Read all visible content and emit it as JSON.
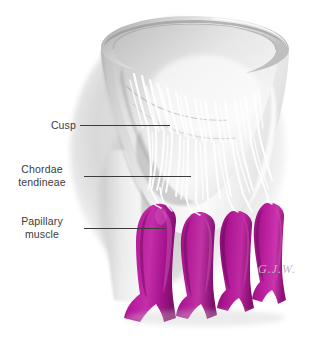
{
  "figure": {
    "signature": "G.J.W.",
    "background_color": "#ffffff"
  },
  "labels": [
    {
      "name": "cusp",
      "line1": "Cusp",
      "line2": ""
    },
    {
      "name": "chordae-tendineae",
      "line1": "Chordae",
      "line2": "tendineae"
    },
    {
      "name": "papillary-muscle",
      "line1": "Papillary",
      "line2": "muscle"
    }
  ],
  "colors": {
    "label_text": "#3b3b3b",
    "leader_line": "#3b3b3b",
    "papillary_muscle": "#b5189b",
    "papillary_muscle_shadow": "#8e1078",
    "papillary_muscle_highlight": "#d04cb9",
    "chordae": "#ffffff",
    "cusp_tissue": "#e7e7e7",
    "cusp_shadow": "#9a9a9a",
    "background_shadow": "#c9c9c9",
    "signature": "#b9b9b9"
  },
  "structures": [
    {
      "name": "valve-cusps-funnel",
      "description": "Funnel-shaped valve cusps seen obliquely from above, pale gray shaded tissue"
    },
    {
      "name": "valve-rim",
      "description": "Elliptical annulus rim at the top opening of the valve funnel"
    },
    {
      "name": "chordae-tendineae-strands",
      "description": "White thread-like tendinous cords fanning from cusp free edges down to papillary muscle tips"
    },
    {
      "name": "papillary-muscles",
      "description": "Four magenta finger-like muscular projections arising from the ventricular wall"
    },
    {
      "name": "ventricular-wall",
      "description": "Pale gray ventricular wall behind and to the left of the papillary muscles"
    }
  ]
}
